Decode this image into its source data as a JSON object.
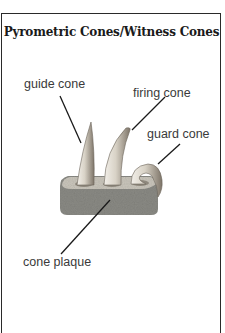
{
  "figure": {
    "title": "Pyrometric Cones/Witness Cones",
    "labels": {
      "guide_cone": "guide cone",
      "firing_cone": "firing cone",
      "guard_cone": "guard cone",
      "cone_plaque": "cone plaque"
    },
    "colors": {
      "border": "#2a2a2a",
      "plaque": "#8a8a84",
      "cone_light": "#e6e2da",
      "cone_dark": "#8f867a",
      "leader_line": "#1a1a1a"
    }
  }
}
